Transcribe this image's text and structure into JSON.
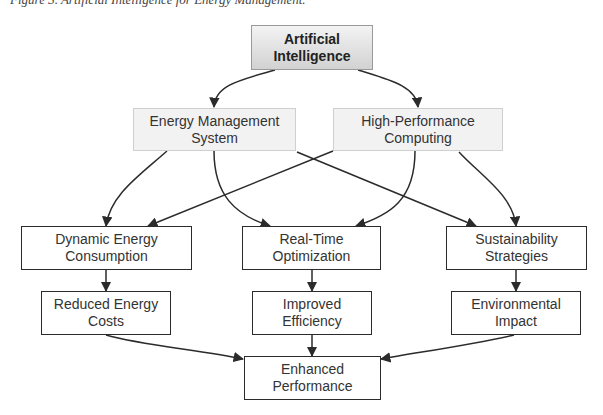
{
  "caption": "Figure 3. Artificial Intelligence for Energy Management.",
  "diagram": {
    "type": "flowchart",
    "nodes": {
      "ai": {
        "line1": "Artificial",
        "line2": "Intelligence"
      },
      "ems": {
        "line1": "Energy Management",
        "line2": "System"
      },
      "hpc": {
        "line1": "High-Performance",
        "line2": "Computing"
      },
      "dec": {
        "line1": "Dynamic Energy",
        "line2": "Consumption"
      },
      "rto": {
        "line1": "Real-Time",
        "line2": "Optimization"
      },
      "ss": {
        "line1": "Sustainability",
        "line2": "Strategies"
      },
      "rec": {
        "line1": "Reduced Energy",
        "line2": "Costs"
      },
      "ie": {
        "line1": "Improved",
        "line2": "Efficiency"
      },
      "ei": {
        "line1": "Environmental",
        "line2": "Impact"
      },
      "ep": {
        "line1": "Enhanced",
        "line2": "Performance"
      }
    },
    "edges": [
      {
        "from": "Artificial Intelligence",
        "to": "Energy Management System"
      },
      {
        "from": "Artificial Intelligence",
        "to": "High-Performance Computing"
      },
      {
        "from": "Energy Management System",
        "to": "Dynamic Energy Consumption"
      },
      {
        "from": "Energy Management System",
        "to": "Real-Time Optimization"
      },
      {
        "from": "Energy Management System",
        "to": "Sustainability Strategies"
      },
      {
        "from": "High-Performance Computing",
        "to": "Dynamic Energy Consumption"
      },
      {
        "from": "High-Performance Computing",
        "to": "Real-Time Optimization"
      },
      {
        "from": "High-Performance Computing",
        "to": "Sustainability Strategies"
      },
      {
        "from": "Dynamic Energy Consumption",
        "to": "Reduced Energy Costs"
      },
      {
        "from": "Real-Time Optimization",
        "to": "Improved Efficiency"
      },
      {
        "from": "Sustainability Strategies",
        "to": "Environmental Impact"
      },
      {
        "from": "Reduced Energy Costs",
        "to": "Enhanced Performance"
      },
      {
        "from": "Improved Efficiency",
        "to": "Enhanced Performance"
      },
      {
        "from": "Environmental Impact",
        "to": "Enhanced Performance"
      }
    ],
    "colors": {
      "line": "#2b2b2b",
      "root_fill_top": "#f3f3f3",
      "root_fill_bottom": "#d2d2d2",
      "level1_fill": "#f2f2f2",
      "box_border": "#2b2b2b"
    }
  }
}
